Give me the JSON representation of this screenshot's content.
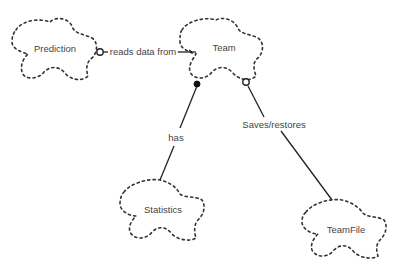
{
  "diagram": {
    "type": "booch-class-diagram",
    "classes": [
      {
        "id": "prediction",
        "name": "Prediction"
      },
      {
        "id": "team",
        "name": "Team"
      },
      {
        "id": "statistics",
        "name": "Statistics"
      },
      {
        "id": "teamfile",
        "name": "TeamFile"
      }
    ],
    "relationships": [
      {
        "from": "prediction",
        "to": "team",
        "label": "reads data from",
        "from_adornment": "open-circle",
        "to_adornment": "bar"
      },
      {
        "from": "team",
        "to": "statistics",
        "label": "has",
        "from_adornment": "filled-circle"
      },
      {
        "from": "team",
        "to": "teamfile",
        "label": "Saves/restores",
        "from_adornment": "open-circle"
      }
    ],
    "colors": {
      "background": "#ffffff",
      "line": "#222222",
      "text": "#444444"
    }
  }
}
